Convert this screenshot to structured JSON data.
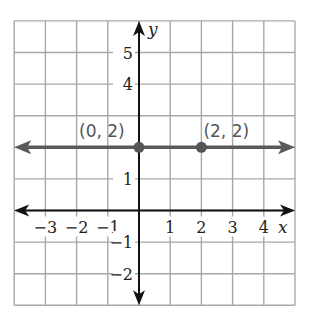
{
  "chart_data": {
    "type": "line",
    "title": "",
    "xlabel": "x",
    "ylabel": "y",
    "xlim": [
      -4,
      5
    ],
    "ylim": [
      -3,
      6
    ],
    "grid": true,
    "x_ticks": [
      -3,
      -2,
      -1,
      1,
      2,
      3,
      4
    ],
    "y_ticks": [
      -2,
      -1,
      1,
      4,
      5
    ],
    "x_tick_labels": [
      "−3",
      "−2",
      "−1",
      "1",
      "2",
      "3",
      "4"
    ],
    "y_tick_labels": [
      "−2",
      "−1",
      "1",
      "4",
      "5"
    ],
    "series": [
      {
        "name": "y = 2",
        "kind": "horizontal line with arrows",
        "y": 2,
        "color": "#5a5a5a"
      }
    ],
    "points": [
      {
        "x": 0,
        "y": 2,
        "label": "(0, 2)"
      },
      {
        "x": 2,
        "y": 2,
        "label": "(2, 2)"
      }
    ]
  },
  "colors": {
    "grid": "#a8a8a8",
    "axis": "#111111",
    "line": "#5a5a5a",
    "point": "#555555"
  }
}
